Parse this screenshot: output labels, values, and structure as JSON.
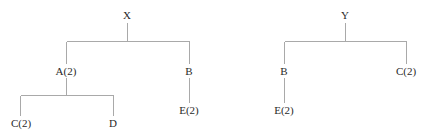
{
  "diagram": {
    "type": "tree-pair",
    "trees": [
      {
        "id": "tree-x",
        "root": {
          "label": "X",
          "x": 127,
          "y": 15,
          "children": [
            {
              "label": "A(2)",
              "x": 66,
              "y": 71,
              "children": [
                {
                  "label": "C(2)",
                  "x": 21,
                  "y": 123,
                  "children": []
                },
                {
                  "label": "D",
                  "x": 113,
                  "y": 123,
                  "children": []
                }
              ]
            },
            {
              "label": "B",
              "x": 189,
              "y": 71,
              "children": [
                {
                  "label": "E(2)",
                  "x": 189,
                  "y": 110,
                  "children": []
                }
              ]
            }
          ]
        }
      },
      {
        "id": "tree-y",
        "root": {
          "label": "Y",
          "x": 345,
          "y": 15,
          "children": [
            {
              "label": "B",
              "x": 284,
              "y": 71,
              "children": [
                {
                  "label": "E(2)",
                  "x": 284,
                  "y": 110,
                  "children": []
                }
              ]
            },
            {
              "label": "C(2)",
              "x": 406,
              "y": 71,
              "children": []
            }
          ]
        }
      }
    ],
    "colors": {
      "edge": "#a9a9a9",
      "text": "#2a2a2a",
      "background": "#ffffff"
    }
  },
  "labels": {
    "x_root": "X",
    "x_a": "A(2)",
    "x_b": "B",
    "x_c": "C(2)",
    "x_d": "D",
    "x_e": "E(2)",
    "y_root": "Y",
    "y_b": "B",
    "y_c": "C(2)",
    "y_e": "E(2)"
  }
}
